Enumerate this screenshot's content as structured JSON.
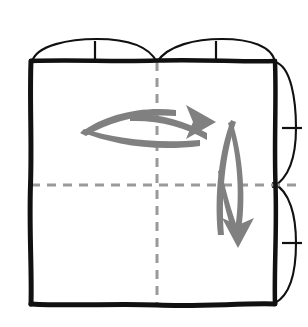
{
  "figure": {
    "title": "Origami folding step diagram",
    "description": "Square sheet seen from above with vertical and horizontal center creases, four curved flap edges with registration tick marks, and two curved motion arrows indicating folding direction.",
    "background_color": "#ffffff",
    "ink_color": "#111111",
    "crease_color": "#9a9a9a",
    "arrow_color": "#808080"
  },
  "sheet": {
    "label": "paper-sheet",
    "left": 30,
    "top": 60,
    "right": 276,
    "bottom": 305,
    "edge_style": "hand-drawn thick black outline"
  },
  "creases": [
    {
      "name": "vertical-center-crease",
      "orientation": "vertical",
      "position": 157,
      "style": "dashed",
      "color": "#9a9a9a"
    },
    {
      "name": "horizontal-center-crease",
      "orientation": "horizontal",
      "position": 185,
      "style": "dashed",
      "color": "#9a9a9a"
    }
  ],
  "flaps": [
    {
      "name": "top-left-flap",
      "edge": "top",
      "side": "left",
      "tick_at": 95
    },
    {
      "name": "top-right-flap",
      "edge": "top",
      "side": "right",
      "tick_at": 216
    },
    {
      "name": "right-upper-flap",
      "edge": "right",
      "side": "upper",
      "tick_at": 128
    },
    {
      "name": "right-lower-flap",
      "edge": "right",
      "side": "lower",
      "tick_at": 243
    }
  ],
  "tick_marks": [
    {
      "name": "tick-top-left",
      "x": 95,
      "y": 51,
      "orientation": "vertical"
    },
    {
      "name": "tick-top-right",
      "x": 216,
      "y": 51,
      "orientation": "vertical"
    },
    {
      "name": "tick-right-upper",
      "x": 290,
      "y": 128,
      "orientation": "horizontal"
    },
    {
      "name": "tick-right-lower",
      "x": 290,
      "y": 243,
      "orientation": "horizontal"
    }
  ],
  "arrows": [
    {
      "name": "horizontal-fold-arrow",
      "direction": "right",
      "shape": "crescent",
      "start": {
        "x": 80,
        "y": 131
      },
      "end": {
        "x": 216,
        "y": 122
      },
      "color": "#808080"
    },
    {
      "name": "vertical-fold-arrow",
      "direction": "down",
      "shape": "crescent",
      "start": {
        "x": 231,
        "y": 120
      },
      "end": {
        "x": 238,
        "y": 248
      },
      "color": "#808080"
    }
  ]
}
